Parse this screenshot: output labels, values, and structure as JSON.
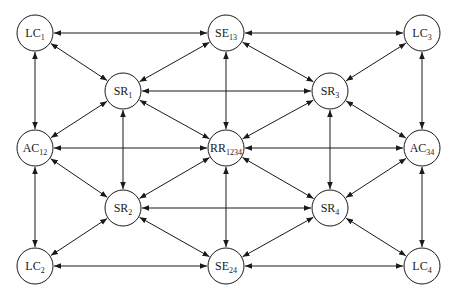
{
  "diagram": {
    "width": 456,
    "height": 297,
    "node_radius": 18,
    "stroke_color": "#1a1a1a",
    "background": "#ffffff",
    "nodes": [
      {
        "id": "LC1",
        "base": "LC",
        "sub": "1",
        "x": 35,
        "y": 33
      },
      {
        "id": "SE13",
        "base": "SE",
        "sub": "13",
        "x": 226,
        "y": 33
      },
      {
        "id": "LC3",
        "base": "LC",
        "sub": "3",
        "x": 422,
        "y": 33
      },
      {
        "id": "SR1",
        "base": "SR",
        "sub": "1",
        "x": 123,
        "y": 91
      },
      {
        "id": "SR3",
        "base": "SR",
        "sub": "3",
        "x": 330,
        "y": 91
      },
      {
        "id": "AC12",
        "base": "AC",
        "sub": "12",
        "x": 35,
        "y": 148
      },
      {
        "id": "RR1234",
        "base": "RR",
        "sub": "1234",
        "x": 226,
        "y": 148
      },
      {
        "id": "AC34",
        "base": "AC",
        "sub": "34",
        "x": 422,
        "y": 148
      },
      {
        "id": "SR2",
        "base": "SR",
        "sub": "2",
        "x": 123,
        "y": 208
      },
      {
        "id": "SR4",
        "base": "SR",
        "sub": "4",
        "x": 330,
        "y": 208
      },
      {
        "id": "LC2",
        "base": "LC",
        "sub": "2",
        "x": 35,
        "y": 266
      },
      {
        "id": "SE24",
        "base": "SE",
        "sub": "24",
        "x": 226,
        "y": 266
      },
      {
        "id": "LC4",
        "base": "LC",
        "sub": "4",
        "x": 422,
        "y": 266
      }
    ],
    "edges": [
      {
        "from": "LC1",
        "to": "SE13",
        "bidirectional": true
      },
      {
        "from": "SE13",
        "to": "LC3",
        "bidirectional": true
      },
      {
        "from": "LC2",
        "to": "SE24",
        "bidirectional": true
      },
      {
        "from": "SE24",
        "to": "LC4",
        "bidirectional": true
      },
      {
        "from": "LC1",
        "to": "AC12",
        "bidirectional": true
      },
      {
        "from": "AC12",
        "to": "LC2",
        "bidirectional": true
      },
      {
        "from": "LC3",
        "to": "AC34",
        "bidirectional": true
      },
      {
        "from": "AC34",
        "to": "LC4",
        "bidirectional": true
      },
      {
        "from": "SE13",
        "to": "RR1234",
        "bidirectional": true
      },
      {
        "from": "RR1234",
        "to": "SE24",
        "bidirectional": true
      },
      {
        "from": "AC12",
        "to": "RR1234",
        "bidirectional": true
      },
      {
        "from": "RR1234",
        "to": "AC34",
        "bidirectional": true
      },
      {
        "from": "SR1",
        "to": "SR3",
        "bidirectional": true
      },
      {
        "from": "SR2",
        "to": "SR4",
        "bidirectional": true
      },
      {
        "from": "SR1",
        "to": "SR2",
        "bidirectional": true
      },
      {
        "from": "SR3",
        "to": "SR4",
        "bidirectional": true
      },
      {
        "from": "SR1",
        "to": "LC1",
        "bidirectional": true
      },
      {
        "from": "SR1",
        "to": "SE13",
        "bidirectional": true
      },
      {
        "from": "SR1",
        "to": "AC12",
        "bidirectional": true
      },
      {
        "from": "SR1",
        "to": "RR1234",
        "bidirectional": true
      },
      {
        "from": "SR3",
        "to": "SE13",
        "bidirectional": true
      },
      {
        "from": "SR3",
        "to": "LC3",
        "bidirectional": true
      },
      {
        "from": "SR3",
        "to": "RR1234",
        "bidirectional": true
      },
      {
        "from": "SR3",
        "to": "AC34",
        "bidirectional": true
      },
      {
        "from": "SR2",
        "to": "AC12",
        "bidirectional": true
      },
      {
        "from": "SR2",
        "to": "RR1234",
        "bidirectional": true
      },
      {
        "from": "SR2",
        "to": "LC2",
        "bidirectional": true
      },
      {
        "from": "SR2",
        "to": "SE24",
        "bidirectional": true
      },
      {
        "from": "SR4",
        "to": "RR1234",
        "bidirectional": true
      },
      {
        "from": "SR4",
        "to": "AC34",
        "bidirectional": true
      },
      {
        "from": "SR4",
        "to": "SE24",
        "bidirectional": true
      },
      {
        "from": "SR4",
        "to": "LC4",
        "bidirectional": true
      }
    ]
  }
}
